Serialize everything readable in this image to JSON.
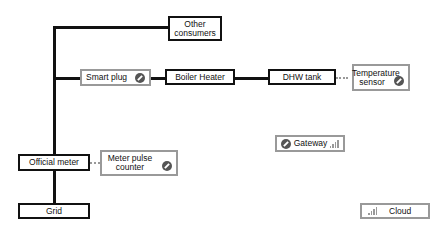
{
  "nodes": {
    "other_consumers": "Other consumers",
    "smart_plug": "Smart plug",
    "boiler_heater": "Boiler Heater",
    "dhw_tank": "DHW tank",
    "temperature_sensor": "Temperature sensor",
    "official_meter": "Official meter",
    "meter_pulse_counter": "Meter pulse counter",
    "grid": "Grid",
    "gateway": "Gateway",
    "cloud": "Cloud"
  },
  "icons": {
    "zwave": "zwave-device-icon",
    "signal": "signal-strength-icon"
  },
  "colors": {
    "dark_border": "#111111",
    "device_border": "#999999",
    "icon": "#555555"
  }
}
